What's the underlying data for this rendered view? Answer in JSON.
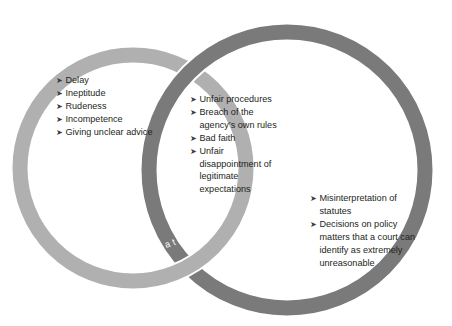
{
  "diagram": {
    "type": "venn",
    "title": "",
    "colors": {
      "ring_maladministration": "#b0b0b0",
      "ring_unlawfulness": "#7a7a7a",
      "label_text": "#ffffff",
      "body_text": "#231f20",
      "background": "#ffffff"
    },
    "bullet_glyph": "➤",
    "circles": [
      {
        "id": "maladministration",
        "label": "Maladministration",
        "label_position": "bottom-arc",
        "fill": "#b0b0b0",
        "cx": 133,
        "cy": 168,
        "r": 113,
        "stroke_width": 15
      },
      {
        "id": "unlawfulness",
        "label": "Unlawfulness",
        "label_position": "top-arc",
        "fill": "#7a7a7a",
        "cx": 287,
        "cy": 170,
        "r": 138,
        "stroke_width": 15
      }
    ],
    "regions": {
      "left_only": {
        "belongs_to": "maladministration",
        "items": [
          "Delay",
          "Ineptitude",
          "Rudeness",
          "Incompetence",
          "Giving unclear advice"
        ]
      },
      "intersection": {
        "belongs_to": "maladministration + unlawfulness",
        "items": [
          "Unfair procedures",
          "Breach of the agency’s own rules",
          "Bad faith",
          "Unfair disappointment of legitimate expectations"
        ]
      },
      "right_only": {
        "belongs_to": "unlawfulness",
        "items": [
          "Misinterpretation of statutes",
          "Decisions on policy matters that a court can identify as extremely unreasonable"
        ]
      }
    }
  }
}
